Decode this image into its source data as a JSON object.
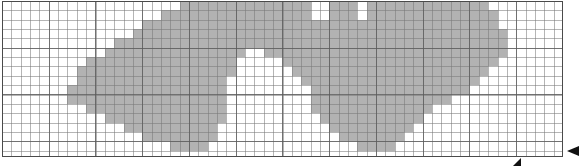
{
  "figure": {
    "kind": "graph-paper-shaded-region",
    "title": "",
    "caption": "",
    "width_px": 582,
    "height_px": 167
  },
  "grid": {
    "cell_size_px": 9.35,
    "major_every_cells": 5,
    "columns": 60,
    "rows": 16,
    "origin_x_px": 2,
    "origin_y_px": 1,
    "plate_width_px": 561,
    "plate_height_px": 156,
    "minor_line_color": "#787878",
    "major_line_color": "#5a5a5a",
    "border_color": "#4a4a4a",
    "paper_color": "#ffffff",
    "shade_color": "#b2b2b2",
    "show_minor": true,
    "show_major": true
  },
  "markers": [
    {
      "name": "right-edge-pointer",
      "glyph": "left-arrow",
      "color": "#111111",
      "x_px": 567,
      "y_px": 151
    },
    {
      "name": "bottom-edge-pointer",
      "glyph": "up-right-triangle",
      "color": "#111111",
      "x_px": 517,
      "y_px": 162
    }
  ],
  "chart_data": {
    "type": "heatmap",
    "title": "",
    "xlabel": "",
    "ylabel": "",
    "columns": 60,
    "rows": 16,
    "legend": [
      {
        "label": "shaded",
        "value": 1,
        "color": "#b2b2b2"
      },
      {
        "label": "empty",
        "value": 0,
        "color": "#ffffff"
      }
    ],
    "shaded_runs": [
      {
        "row": 0,
        "runs": [
          [
            19,
            32
          ],
          [
            35,
            37
          ],
          [
            39,
            51
          ]
        ]
      },
      {
        "row": 1,
        "runs": [
          [
            17,
            32
          ],
          [
            35,
            37
          ],
          [
            39,
            52
          ]
        ]
      },
      {
        "row": 2,
        "runs": [
          [
            15,
            33
          ],
          [
            34,
            52
          ]
        ]
      },
      {
        "row": 3,
        "runs": [
          [
            14,
            53
          ]
        ]
      },
      {
        "row": 4,
        "runs": [
          [
            12,
            53
          ]
        ]
      },
      {
        "row": 5,
        "runs": [
          [
            11,
            25
          ],
          [
            28,
            53
          ]
        ]
      },
      {
        "row": 6,
        "runs": [
          [
            9,
            24
          ],
          [
            30,
            52
          ]
        ]
      },
      {
        "row": 7,
        "runs": [
          [
            8,
            24
          ],
          [
            31,
            51
          ]
        ]
      },
      {
        "row": 8,
        "runs": [
          [
            8,
            23
          ],
          [
            32,
            50
          ]
        ]
      },
      {
        "row": 9,
        "runs": [
          [
            7,
            23
          ],
          [
            33,
            49
          ]
        ]
      },
      {
        "row": 10,
        "runs": [
          [
            7,
            23
          ],
          [
            33,
            47
          ]
        ]
      },
      {
        "row": 11,
        "runs": [
          [
            9,
            23
          ],
          [
            33,
            45
          ]
        ]
      },
      {
        "row": 12,
        "runs": [
          [
            11,
            23
          ],
          [
            34,
            44
          ]
        ]
      },
      {
        "row": 13,
        "runs": [
          [
            13,
            22
          ],
          [
            35,
            43
          ]
        ]
      },
      {
        "row": 14,
        "runs": [
          [
            15,
            22
          ],
          [
            36,
            42
          ]
        ]
      },
      {
        "row": 15,
        "runs": [
          [
            18,
            21
          ],
          [
            38,
            41
          ]
        ]
      }
    ],
    "shaded_cell_count": 700,
    "total_cell_count": 960
  }
}
